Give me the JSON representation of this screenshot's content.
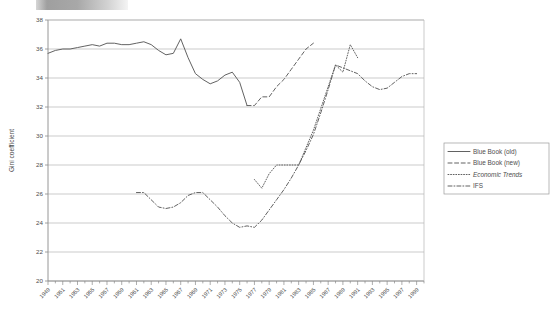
{
  "figure": {
    "decor_bar": "grey-gradient-bar",
    "background_color": "#ffffff",
    "line_color": "#5a5a5a",
    "grid_color": "#b5b5b5"
  },
  "chart_data": {
    "type": "line",
    "title": "",
    "xlabel": "",
    "ylabel": "Gini coefficient",
    "xlim": [
      1949,
      2000
    ],
    "ylim": [
      20,
      38
    ],
    "yticks": [
      20,
      22,
      24,
      26,
      28,
      30,
      32,
      34,
      36,
      38
    ],
    "xticks": [
      1949,
      1951,
      1953,
      1955,
      1957,
      1959,
      1961,
      1963,
      1965,
      1967,
      1969,
      1971,
      1973,
      1975,
      1977,
      1979,
      1981,
      1983,
      1985,
      1987,
      1989,
      1991,
      1993,
      1995,
      1997,
      1999
    ],
    "grid": "horizontal",
    "legend_position": "right",
    "series": [
      {
        "name": "Blue Book (old)",
        "style": "solid",
        "x": [
          1949,
          1950,
          1951,
          1952,
          1953,
          1954,
          1955,
          1956,
          1957,
          1958,
          1959,
          1960,
          1961,
          1962,
          1963,
          1964,
          1965,
          1966,
          1967,
          1968,
          1969,
          1970,
          1971,
          1972,
          1973,
          1974,
          1975,
          1976
        ],
        "values": [
          35.7,
          35.9,
          36.0,
          36.0,
          36.1,
          36.2,
          36.3,
          36.2,
          36.4,
          36.4,
          36.3,
          36.3,
          36.4,
          36.5,
          36.3,
          35.9,
          35.6,
          35.7,
          36.7,
          35.4,
          34.3,
          33.9,
          33.6,
          33.8,
          34.2,
          34.4,
          33.7,
          32.1
        ]
      },
      {
        "name": "Blue Book (new)",
        "style": "dashed",
        "x": [
          1976,
          1977,
          1978,
          1979,
          1980,
          1981,
          1982,
          1983,
          1984,
          1985
        ],
        "values": [
          32.1,
          32.1,
          32.7,
          32.7,
          33.4,
          33.9,
          34.6,
          35.3,
          36.0,
          36.4
        ]
      },
      {
        "name": "Economic Trends",
        "style": "dotted",
        "x": [
          1977,
          1978,
          1979,
          1980,
          1981,
          1982,
          1983,
          1984,
          1985,
          1986,
          1987,
          1988,
          1989,
          1990,
          1991
        ],
        "values": [
          27.0,
          26.4,
          27.4,
          28.0,
          28.0,
          28.0,
          28.0,
          29.2,
          30.4,
          31.9,
          33.4,
          34.9,
          34.4,
          36.3,
          35.4
        ]
      },
      {
        "name": "IFS",
        "style": "dash-dot",
        "x": [
          1961,
          1962,
          1963,
          1964,
          1965,
          1966,
          1967,
          1968,
          1969,
          1970,
          1971,
          1972,
          1973,
          1974,
          1975,
          1976,
          1977,
          1978,
          1979,
          1980,
          1981,
          1982,
          1983,
          1984,
          1985,
          1986,
          1987,
          1988,
          1989,
          1990,
          1991,
          1992,
          1993,
          1994,
          1995,
          1996,
          1997,
          1998,
          1999
        ],
        "values": [
          26.1,
          26.1,
          25.6,
          25.1,
          25.0,
          25.1,
          25.4,
          25.9,
          26.1,
          26.1,
          25.6,
          25.1,
          24.5,
          24.0,
          23.7,
          23.8,
          23.7,
          24.2,
          24.9,
          25.6,
          26.3,
          27.1,
          28.0,
          29.0,
          30.1,
          31.6,
          33.2,
          34.9,
          34.7,
          34.5,
          34.3,
          33.8,
          33.4,
          33.2,
          33.3,
          33.7,
          34.1,
          34.3,
          34.3
        ]
      }
    ]
  },
  "legend": {
    "items": [
      {
        "label": "Blue Book (old)",
        "style": "solid",
        "italic": false
      },
      {
        "label": "Blue Book (new)",
        "style": "dashed",
        "italic": false
      },
      {
        "label": "Economic Trends",
        "style": "dotted",
        "italic": true
      },
      {
        "label": "IFS",
        "style": "dash-dot",
        "italic": false
      }
    ]
  }
}
